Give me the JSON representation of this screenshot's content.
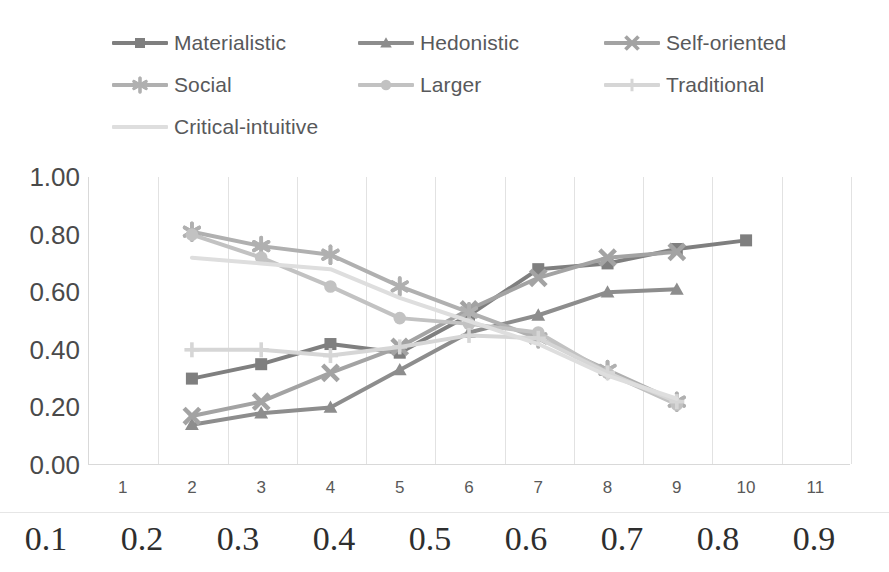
{
  "legend": {
    "items": [
      {
        "label": "Materialistic",
        "color": "#7f7f7f",
        "marker": "square-marker"
      },
      {
        "label": "Hedonistic",
        "color": "#8d8d8d",
        "marker": "triangle-marker"
      },
      {
        "label": "Self-oriented",
        "color": "#a3a3a3",
        "marker": "x-marker"
      },
      {
        "label": "Social",
        "color": "#b0b0b0",
        "marker": "asterisk-marker"
      },
      {
        "label": "Larger",
        "color": "#c2c2c2",
        "marker": "circle-marker"
      },
      {
        "label": "Traditional",
        "color": "#d6d6d6",
        "marker": "plus-marker"
      },
      {
        "label": "Critical-intuitive",
        "color": "#dedede",
        "marker": "none-marker"
      }
    ]
  },
  "axes": {
    "y_ticks": [
      "1.00",
      "0.80",
      "0.60",
      "0.40",
      "0.20",
      "0.00"
    ],
    "x_ticks": [
      "1",
      "2",
      "3",
      "4",
      "5",
      "6",
      "7",
      "8",
      "9",
      "10",
      "11"
    ],
    "ruler_labels": [
      "0.1",
      "0.2",
      "0.3",
      "0.4",
      "0.5",
      "0.6",
      "0.7",
      "0.8",
      "0.9"
    ]
  },
  "chart_data": {
    "type": "line",
    "title": "",
    "xlabel": "",
    "ylabel": "",
    "ylim": [
      0.0,
      1.0
    ],
    "ytick_step": 0.2,
    "grid": "vertical",
    "legend_position": "top",
    "categories": [
      1,
      2,
      3,
      4,
      5,
      6,
      7,
      8,
      9,
      10,
      11
    ],
    "series": [
      {
        "name": "Materialistic",
        "color": "#7f7f7f",
        "marker": "square",
        "x": [
          2,
          3,
          4,
          5,
          6,
          7,
          8,
          9,
          10
        ],
        "values": [
          0.3,
          0.35,
          0.42,
          0.39,
          0.52,
          0.68,
          0.7,
          0.75,
          0.78
        ]
      },
      {
        "name": "Hedonistic",
        "color": "#8d8d8d",
        "marker": "triangle",
        "x": [
          2,
          3,
          4,
          5,
          6,
          7,
          8,
          9
        ],
        "values": [
          0.14,
          0.18,
          0.2,
          0.33,
          0.46,
          0.52,
          0.6,
          0.61
        ]
      },
      {
        "name": "Self-oriented",
        "color": "#a3a3a3",
        "marker": "x",
        "x": [
          2,
          3,
          4,
          5,
          6,
          7,
          8,
          9
        ],
        "values": [
          0.17,
          0.22,
          0.32,
          0.41,
          0.54,
          0.65,
          0.72,
          0.74
        ]
      },
      {
        "name": "Social",
        "color": "#b0b0b0",
        "marker": "asterisk",
        "x": [
          2,
          3,
          4,
          5,
          6,
          7,
          8,
          9
        ],
        "values": [
          0.81,
          0.76,
          0.73,
          0.62,
          0.53,
          0.44,
          0.33,
          0.22
        ]
      },
      {
        "name": "Larger",
        "color": "#c2c2c2",
        "marker": "circle",
        "x": [
          2,
          3,
          4,
          5,
          6,
          7,
          8,
          9
        ],
        "values": [
          0.8,
          0.72,
          0.62,
          0.51,
          0.49,
          0.46,
          0.32,
          0.21
        ]
      },
      {
        "name": "Traditional",
        "color": "#d6d6d6",
        "marker": "plus",
        "x": [
          2,
          3,
          4,
          5,
          6,
          7,
          8,
          9
        ],
        "values": [
          0.4,
          0.4,
          0.38,
          0.41,
          0.45,
          0.44,
          0.32,
          0.22
        ]
      },
      {
        "name": "Critical-intuitive",
        "color": "#dedede",
        "marker": "none",
        "x": [
          2,
          3,
          4,
          5,
          6,
          7,
          8,
          9
        ],
        "values": [
          0.72,
          0.7,
          0.68,
          0.58,
          0.5,
          0.42,
          0.31,
          0.23
        ]
      }
    ]
  }
}
